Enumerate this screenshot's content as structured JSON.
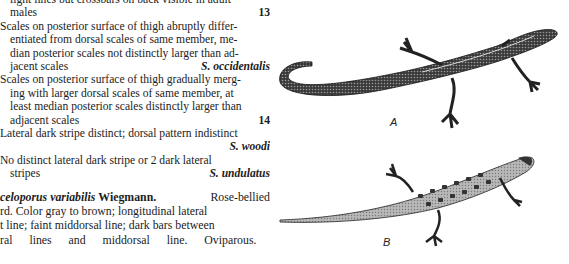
{
  "key": {
    "lines": [
      {
        "text": "light lines but crossbars on back visible in adult",
        "indent": true
      },
      {
        "text": "males",
        "indent": true,
        "ref": "13"
      },
      {
        "text": "Scales on posterior surface of thigh abruptly differ-",
        "indent": false
      },
      {
        "text": "entiated from dorsal scales of same member, me-",
        "indent": true
      },
      {
        "text": "dian posterior scales not distinctly larger than ad-",
        "indent": true
      },
      {
        "text": "jacent scales",
        "indent": true,
        "species": "S. occidentalis"
      },
      {
        "text": "Scales on posterior surface of thigh gradually merg-",
        "indent": false
      },
      {
        "text": "ing with larger dorsal scales of same member, at",
        "indent": true
      },
      {
        "text": "least median posterior scales distinctly larger than",
        "indent": true
      },
      {
        "text": "adjacent scales",
        "indent": true,
        "ref": "14"
      },
      {
        "text": "Lateral dark stripe distinct; dorsal pattern indistinct",
        "indent": false
      },
      {
        "text": "",
        "indent": true,
        "species": "S. woodi"
      },
      {
        "text": "No distinct lateral dark stripe or 2 dark lateral",
        "indent": false
      },
      {
        "text": "stripes",
        "indent": true,
        "species": "S. undulatus"
      }
    ]
  },
  "description": {
    "genus_partial": "celoporus",
    "species": "variabilis",
    "author": "Wiegmann.",
    "common_name": "Rose-bellied",
    "lines": [
      "rd. Color gray to brown; longitudinal lateral",
      "t line; faint middorsal line; dark bars between",
      "ral lines and middorsal line. Oviparous."
    ]
  },
  "figures": [
    {
      "label": "A",
      "subject": "lizard-illustration-uniform-pattern"
    },
    {
      "label": "B",
      "subject": "lizard-illustration-barred-pattern"
    }
  ]
}
